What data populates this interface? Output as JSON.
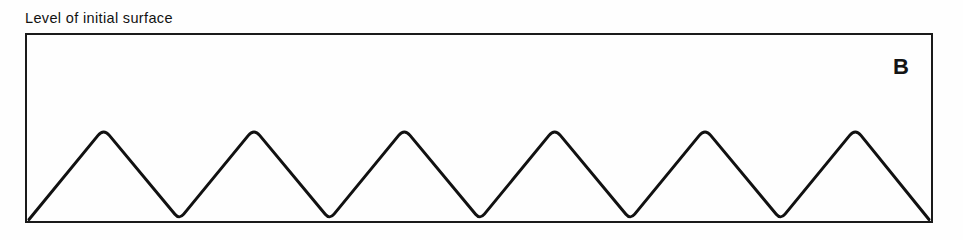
{
  "figure": {
    "caption": "Level of initial surface",
    "panel_letter": "B",
    "line_color": "#111111",
    "frame_color": "#1a1a1a",
    "background_color": "#fefefe"
  },
  "chart_data": {
    "type": "line",
    "title": "Level of initial surface",
    "subtitle": "",
    "xlabel": "",
    "ylabel": "",
    "annotations": [
      {
        "text": "Level of initial surface",
        "position": "above-frame-left"
      },
      {
        "text": "B",
        "position": "inside-frame-top-right"
      }
    ],
    "grid": false,
    "legend": null,
    "frame": {
      "left": 25,
      "top": 33,
      "width": 908,
      "height": 190
    },
    "xlim": [
      0,
      908
    ],
    "ylim": [
      0,
      190
    ],
    "series": [
      {
        "name": "surface profile",
        "description": "Six rounded-apex triangular ridges rising from a flat baseline; troughs touch the baseline.",
        "n_peaks": 6,
        "period": 151,
        "amplitude": 93,
        "baseline_y": 222,
        "peak_top_y": 129,
        "apex_radius": 9,
        "trough_radius": 7,
        "peaks_x": [
          102,
          253,
          404,
          555,
          706,
          857
        ],
        "troughs_x": [
          27,
          178,
          329,
          480,
          631,
          782,
          931
        ]
      }
    ]
  }
}
